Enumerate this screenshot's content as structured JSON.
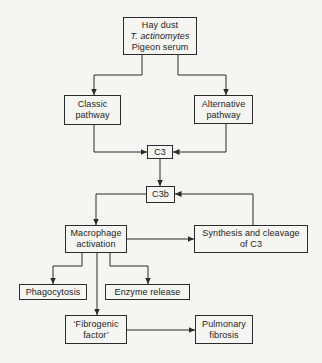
{
  "diagram": {
    "type": "flowchart",
    "background_color": "#f5f5f2",
    "line_color": "#2b2b2b",
    "text_color": "#1c1c1c",
    "nodes": {
      "source": {
        "lines": [
          "Hay dust",
          "T. actinomytes",
          "Pigeon serum"
        ]
      },
      "classic": {
        "lines": [
          "Classic",
          "pathway"
        ]
      },
      "alternative": {
        "lines": [
          "Alternative",
          "pathway"
        ]
      },
      "c3": {
        "label": "C3"
      },
      "c3b": {
        "label": "C3b"
      },
      "macrophage": {
        "lines": [
          "Macrophage",
          "activation"
        ]
      },
      "synthesis": {
        "lines": [
          "Synthesis and cleavage",
          "of C3"
        ]
      },
      "phagocytosis": {
        "label": "Phagocytosis"
      },
      "enzyme": {
        "label": "Enzyme release"
      },
      "fibrogenic": {
        "lines": [
          "‘Fibrogenic",
          "factor’"
        ]
      },
      "pulmonary": {
        "lines": [
          "Pulmonary",
          "fibrosis"
        ]
      }
    },
    "edges": [
      {
        "from": "source",
        "to": "classic",
        "points": "142,55 142,75 94,75 94,95"
      },
      {
        "from": "source",
        "to": "alternative",
        "points": "178,55 178,75 226,75 226,95"
      },
      {
        "from": "classic",
        "to": "c3",
        "points": "94,125 94,152 147,152"
      },
      {
        "from": "alternative",
        "to": "c3",
        "points": "226,124 226,152 173,152"
      },
      {
        "from": "c3",
        "to": "c3b",
        "points": "160,159 160,186"
      },
      {
        "from": "c3b",
        "to": "macrophage",
        "points": "146,194 96,194 96,225"
      },
      {
        "from": "synthesis",
        "to": "c3b",
        "points": "253,225 253,194 175,194"
      },
      {
        "from": "macrophage",
        "to": "synthesis",
        "points": "127,239 194,239"
      },
      {
        "from": "macrophage",
        "to": "phagocytosis",
        "points": "82,253 82,266 53,266 53,284"
      },
      {
        "from": "macrophage",
        "to": "enzyme",
        "points": "110,253 110,266 148,266 148,284"
      },
      {
        "from": "macrophage",
        "to": "fibrogenic",
        "points": "97,253 97,315"
      },
      {
        "from": "fibrogenic",
        "to": "pulmonary",
        "points": "127,330 195,330"
      }
    ]
  }
}
